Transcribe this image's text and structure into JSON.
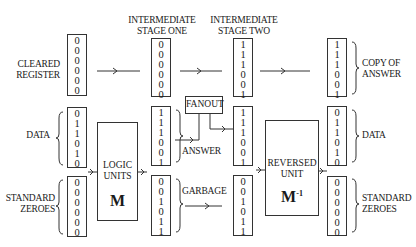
{
  "headers": {
    "stage_one": [
      "INTERMEDIATE",
      "STAGE ONE"
    ],
    "stage_two": [
      "INTERMEDIATE",
      "STAGE TWO"
    ]
  },
  "input_column": {
    "cleared_register": {
      "label": [
        "CLEARED",
        "REGISTER"
      ],
      "bits": [
        "0",
        "0",
        "0",
        "0",
        "0",
        "0"
      ]
    },
    "data": {
      "label": [
        "DATA"
      ],
      "bits": [
        "0",
        "1",
        "1",
        "0",
        "1",
        "0"
      ]
    },
    "standard_zeroes": {
      "label": [
        "STANDARD",
        "ZEROES"
      ],
      "bits": [
        "0",
        "0",
        "0",
        "0",
        "0",
        "0"
      ]
    }
  },
  "logic_units": {
    "label": [
      "LOGIC",
      "UNITS"
    ],
    "symbol": "M"
  },
  "stage_one": {
    "top": {
      "bits": [
        "0",
        "0",
        "0",
        "0",
        "0",
        "0"
      ]
    },
    "answer": {
      "label": "ANSWER",
      "bits": [
        "1",
        "1",
        "1",
        "0",
        "0",
        "1"
      ]
    },
    "garbage": {
      "label": "GARBAGE",
      "bits": [
        "0",
        "0",
        "1",
        "0",
        "1",
        "1"
      ]
    }
  },
  "fanout": {
    "label": "FANOUT"
  },
  "stage_two": {
    "top": {
      "bits": [
        "1",
        "1",
        "1",
        "0",
        "0",
        "1"
      ]
    },
    "answer": {
      "bits": [
        "1",
        "1",
        "1",
        "0",
        "0",
        "1"
      ]
    },
    "garbage": {
      "bits": [
        "0",
        "0",
        "1",
        "0",
        "1",
        "1"
      ]
    }
  },
  "reversed_unit": {
    "label": [
      "REVERSED",
      "UNIT"
    ],
    "symbol": "M",
    "superscript": "-1"
  },
  "output_column": {
    "copy_of_answer": {
      "label": [
        "COPY OF",
        "ANSWER"
      ],
      "bits": [
        "1",
        "1",
        "1",
        "0",
        "0",
        "1"
      ]
    },
    "data": {
      "label": [
        "DATA"
      ],
      "bits": [
        "0",
        "1",
        "1",
        "0",
        "1",
        "0"
      ]
    },
    "standard_zeroes": {
      "label": [
        "STANDARD",
        "ZEROES"
      ],
      "bits": [
        "0",
        "0",
        "0",
        "0",
        "0",
        "0"
      ]
    }
  }
}
